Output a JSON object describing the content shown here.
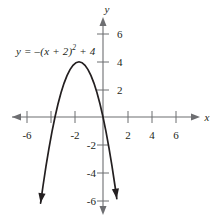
{
  "figure": {
    "equation_label": "y = –(x + 2)",
    "equation_exponent": "2",
    "equation_tail": " + 4",
    "x_axis_name": "x",
    "y_axis_name": "y"
  },
  "chart_data": {
    "type": "line",
    "title": "",
    "subtitle": "",
    "xlabel": "x",
    "ylabel": "y",
    "equation": "y = -(x + 2)^2 + 4",
    "curve_name": "parabola",
    "vertex": [
      -2,
      4
    ],
    "opens": "down",
    "x_intercepts": [
      -4,
      0
    ],
    "y_intercept": 0,
    "xlim": [
      -7.6,
      8.0
    ],
    "ylim": [
      -7.4,
      6.9
    ],
    "grid": false,
    "legend": null,
    "x_tick_values": [
      -6,
      -4,
      -2,
      2,
      4,
      6
    ],
    "x_tick_labels": [
      "-6",
      "",
      "-2",
      "2",
      "4",
      "6"
    ],
    "y_tick_values": [
      6,
      4,
      2,
      -2,
      -4,
      -6
    ],
    "y_tick_labels": [
      "6",
      "4",
      "2",
      "-2",
      "-4",
      "-6"
    ],
    "series": [
      {
        "name": "y = -(x + 2)^2 + 4",
        "x": [
          -5.2,
          -5.0,
          -4.75,
          -4.5,
          -4.25,
          -4.0,
          -3.75,
          -3.5,
          -3.25,
          -3.0,
          -2.75,
          -2.5,
          -2.25,
          -2.0,
          -1.75,
          -1.5,
          -1.25,
          -1.0,
          -0.75,
          -0.5,
          -0.25,
          0.0,
          0.25,
          0.5,
          0.75,
          1.0,
          1.15
        ],
        "y": [
          -6.24,
          -5.0,
          -3.5625,
          -2.25,
          -1.0625,
          0.0,
          0.9375,
          1.75,
          2.4375,
          3.0,
          3.4375,
          3.75,
          3.9375,
          4.0,
          3.9375,
          3.75,
          3.4375,
          3.0,
          2.4375,
          1.75,
          0.9375,
          0.0,
          -1.0625,
          -2.25,
          -3.5625,
          -5.0,
          -5.9225
        ]
      }
    ],
    "annotations": [
      {
        "text": "y = –(x + 2)² + 4",
        "x": -6.6,
        "y": 5.0
      }
    ]
  }
}
